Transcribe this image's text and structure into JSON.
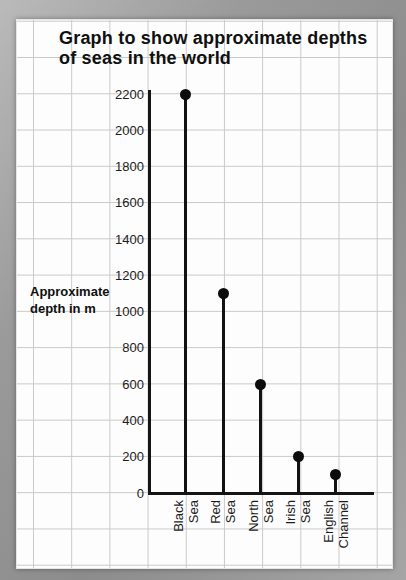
{
  "page": {
    "title_line1": "Graph to show approximate depths",
    "title_line2": "of seas in the world",
    "ylabel_line1": "Approximate",
    "ylabel_line2": "depth in m"
  },
  "chart_data": {
    "type": "bar",
    "style": "lollipop",
    "title": "Graph to show approximate depths of seas in the world",
    "ylabel": "Approximate depth in m",
    "xlabel": "",
    "categories": [
      "Black Sea",
      "Red Sea",
      "North Sea",
      "Irish Sea",
      "English Channel"
    ],
    "values": [
      2200,
      1100,
      600,
      200,
      100
    ],
    "ylim": [
      0,
      2200
    ],
    "yticks": [
      0,
      200,
      400,
      600,
      800,
      1000,
      1200,
      1400,
      1600,
      1800,
      2000,
      2200
    ],
    "grid": true,
    "legend": "none",
    "colors": {
      "ink": "#121212",
      "grid_line": "#c9c9c9",
      "page_bg": "#fdfdfd",
      "border_gray": "#9a9a9a"
    }
  }
}
